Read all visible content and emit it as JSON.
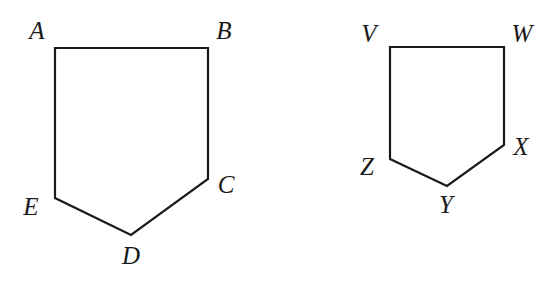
{
  "figure": {
    "stroke_color": "#1a1a1a",
    "background": "#ffffff"
  },
  "shapes": [
    {
      "name": "pentagon-ABCDE",
      "vertices": [
        {
          "label": "A",
          "x": 55,
          "y": 48,
          "lx": 37,
          "ly": 33
        },
        {
          "label": "B",
          "x": 208,
          "y": 48,
          "lx": 224,
          "ly": 33
        },
        {
          "label": "C",
          "x": 208,
          "y": 179,
          "lx": 226,
          "ly": 187
        },
        {
          "label": "D",
          "x": 131,
          "y": 235,
          "lx": 131,
          "ly": 258
        },
        {
          "label": "E",
          "x": 55,
          "y": 198,
          "lx": 31,
          "ly": 209
        }
      ]
    },
    {
      "name": "pentagon-VWXYZ",
      "vertices": [
        {
          "label": "V",
          "x": 390,
          "y": 47,
          "lx": 369,
          "ly": 36
        },
        {
          "label": "W",
          "x": 504,
          "y": 47,
          "lx": 522,
          "ly": 36
        },
        {
          "label": "X",
          "x": 504,
          "y": 145,
          "lx": 521,
          "ly": 149
        },
        {
          "label": "Y",
          "x": 447,
          "y": 186,
          "lx": 446,
          "ly": 207
        },
        {
          "label": "Z",
          "x": 390,
          "y": 159,
          "lx": 367,
          "ly": 169
        }
      ]
    }
  ],
  "labels": {
    "A": "A",
    "B": "B",
    "C": "C",
    "D": "D",
    "E": "E",
    "V": "V",
    "W": "W",
    "X": "X",
    "Y": "Y",
    "Z": "Z"
  }
}
